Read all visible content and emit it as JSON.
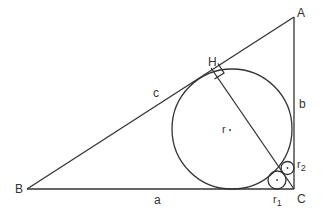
{
  "diagram": {
    "type": "geometry",
    "vertices": {
      "A": {
        "label": "A"
      },
      "B": {
        "label": "B"
      },
      "C": {
        "label": "C"
      },
      "H": {
        "label": "H"
      }
    },
    "sides": {
      "a": {
        "label": "a"
      },
      "b": {
        "label": "b"
      },
      "c": {
        "label": "c"
      }
    },
    "circles": {
      "r": {
        "label": "r"
      },
      "r1": {
        "label": "r",
        "sub": "1"
      },
      "r2": {
        "label": "r",
        "sub": "2"
      }
    },
    "colors": {
      "stroke": "#333333",
      "background": "#ffffff"
    }
  }
}
